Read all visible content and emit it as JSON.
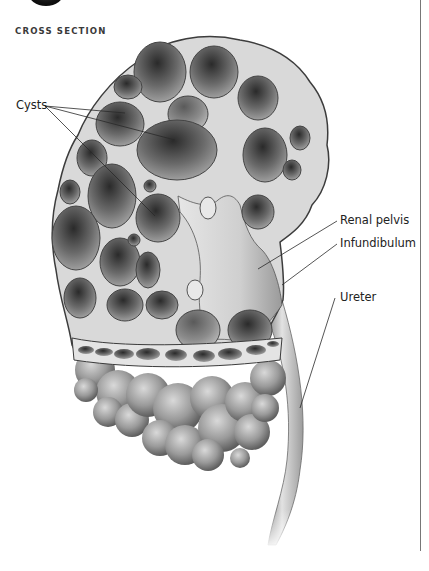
{
  "figure": {
    "title": "CROSS SECTION",
    "labels": {
      "cysts": "Cysts",
      "renal_pelvis": "Renal pelvis",
      "infundibulum": "Infundibulum",
      "ureter": "Ureter"
    },
    "colors": {
      "background": "#ffffff",
      "tissue": "#d8d8d8",
      "cyst_dark": "#3a3a3a",
      "outline": "#444444",
      "label_text": "#222222"
    }
  }
}
